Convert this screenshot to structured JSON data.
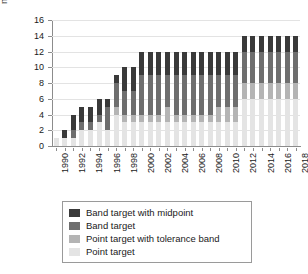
{
  "chart_data": {
    "type": "bar",
    "stacked": true,
    "title": "",
    "xlabel": "",
    "ylabel": "number of countries",
    "ylim": [
      0,
      16
    ],
    "ytick_step": 2,
    "yticks": [
      0,
      2,
      4,
      6,
      8,
      10,
      12,
      14,
      16
    ],
    "grid": true,
    "legend_position": "bottom",
    "x": [
      1990,
      1991,
      1992,
      1993,
      1994,
      1995,
      1996,
      1997,
      1998,
      1999,
      2000,
      2001,
      2002,
      2003,
      2004,
      2005,
      2006,
      2007,
      2008,
      2009,
      2010,
      2011,
      2012,
      2013,
      2014,
      2015,
      2016,
      2017,
      2018
    ],
    "xtick_labels": [
      "1990",
      "1992",
      "1994",
      "1996",
      "1998",
      "2000",
      "2002",
      "2004",
      "2006",
      "2008",
      "2010",
      "2012",
      "2014",
      "2016",
      "2018"
    ],
    "series": [
      {
        "name": "Band target with midpoint",
        "color": "#3a3a3a",
        "values": [
          0,
          1,
          2,
          2,
          2,
          2,
          1,
          1,
          3,
          3,
          3,
          3,
          3,
          3,
          3,
          3,
          3,
          3,
          3,
          3,
          3,
          3,
          2,
          2,
          2,
          2,
          2,
          2,
          2
        ]
      },
      {
        "name": "Band target",
        "color": "#6e6e6e",
        "values": [
          0,
          0,
          1,
          1,
          1,
          1,
          3,
          3,
          3,
          3,
          5,
          5,
          5,
          4,
          5,
          5,
          5,
          5,
          5,
          4,
          4,
          4,
          4,
          4,
          4,
          4,
          4,
          4,
          4
        ]
      },
      {
        "name": "Point target with tolerance band",
        "color": "#b4b4b4",
        "values": [
          0,
          0,
          0,
          0,
          0,
          0,
          0,
          1,
          1,
          1,
          1,
          1,
          1,
          2,
          1,
          1,
          1,
          1,
          1,
          2,
          2,
          2,
          2,
          2,
          2,
          2,
          2,
          2,
          2
        ]
      },
      {
        "name": "Point target",
        "color": "#e4e4e4",
        "values": [
          1,
          1,
          1,
          2,
          2,
          3,
          2,
          4,
          3,
          3,
          3,
          3,
          3,
          3,
          3,
          3,
          3,
          3,
          3,
          3,
          3,
          3,
          6,
          6,
          6,
          6,
          6,
          6,
          6
        ]
      }
    ],
    "totals": [
      1,
      2,
      4,
      5,
      5,
      6,
      6,
      9,
      10,
      10,
      12,
      12,
      12,
      12,
      12,
      12,
      12,
      12,
      12,
      12,
      12,
      12,
      14,
      14,
      14,
      14,
      14,
      14,
      14
    ]
  },
  "legend": {
    "items": [
      {
        "label": "Band target with midpoint"
      },
      {
        "label": "Band target"
      },
      {
        "label": "Point target with tolerance band"
      },
      {
        "label": "Point target"
      }
    ]
  }
}
